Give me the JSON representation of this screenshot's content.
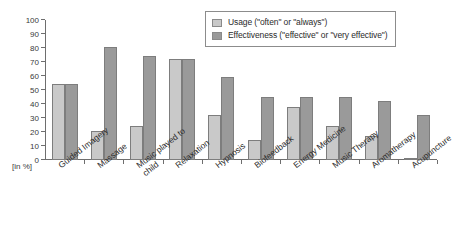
{
  "chart_data": {
    "type": "bar",
    "title": "",
    "subtitle": "",
    "xlabel": "",
    "ylabel": "[in %]",
    "ylim": [
      0,
      100
    ],
    "yticks": [
      0,
      10,
      20,
      30,
      40,
      50,
      60,
      70,
      80,
      90,
      100
    ],
    "ytick_labels": [
      "0",
      "10",
      "20",
      "30",
      "40",
      "50",
      "60",
      "70",
      "80",
      "90",
      "100"
    ],
    "grid": false,
    "legend_position": "top-right",
    "categories": [
      "Guided Imagery",
      "Massage",
      "Music played to\nchild",
      "Relaxation",
      "Hypnosis",
      "Biofeedback",
      "Energy Medicine",
      "Music Therapy",
      "Aromatherapy",
      "Acupuncture"
    ],
    "series": [
      {
        "name": "Usage (\"often\" or \"always\")",
        "color": "#c9c9c9",
        "values": [
          54,
          21,
          24,
          72,
          32,
          14,
          38,
          24,
          17,
          0.5
        ]
      },
      {
        "name": "Effectiveness (\"effective\" or \"very effective\")",
        "color": "#9a9a9a",
        "values": [
          54,
          81,
          74,
          72,
          59,
          45,
          45,
          45,
          42,
          32
        ]
      }
    ]
  },
  "legend": {
    "items": [
      {
        "label": "Usage (\"often\" or \"always\")",
        "color": "#c9c9c9"
      },
      {
        "label": "Effectiveness (\"effective\" or \"very effective\")",
        "color": "#9a9a9a"
      }
    ]
  },
  "axis": {
    "unit_label": "[in %]"
  }
}
